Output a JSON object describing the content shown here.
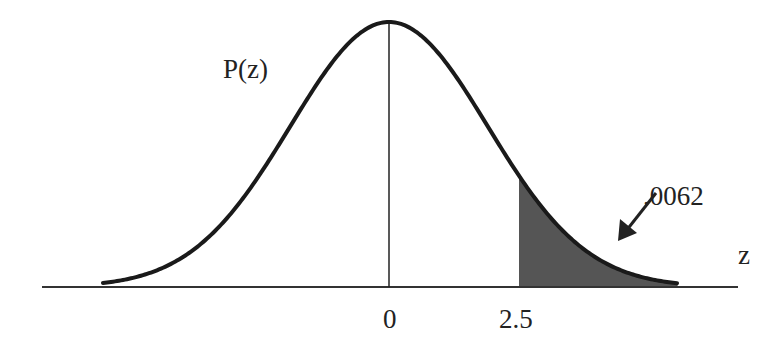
{
  "figure": {
    "curve_label": "P(z)",
    "axis_label": "z",
    "ticks": [
      {
        "label": "0",
        "z": 0
      },
      {
        "label": "2.5",
        "z": 2.5
      }
    ],
    "shaded_area": {
      "label": ".0062",
      "from_z": 2.5,
      "to": "right tail"
    },
    "colors": {
      "curve": "#1a1a1a",
      "axis": "#333333",
      "shade": "#555555",
      "text": "#222222",
      "background": "#ffffff"
    }
  }
}
